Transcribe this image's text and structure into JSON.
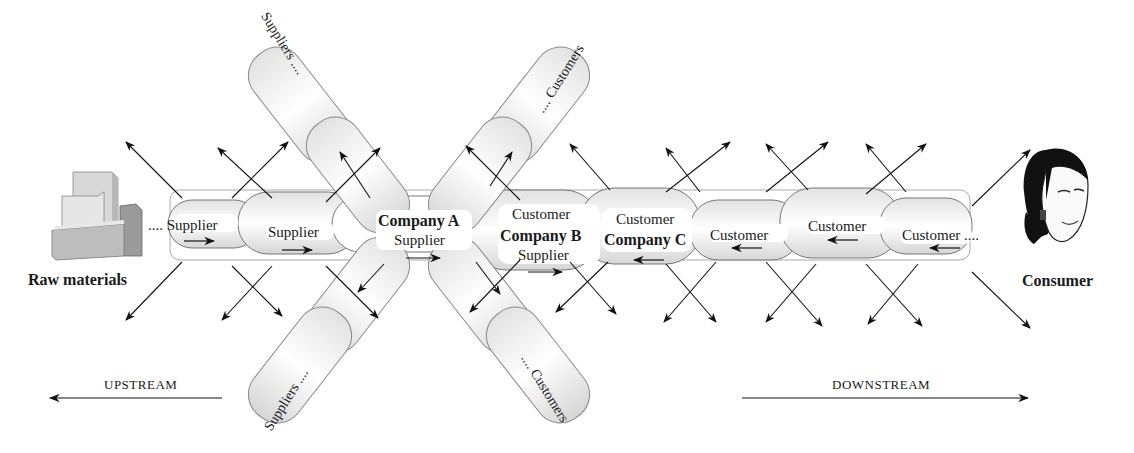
{
  "diagram": {
    "endpoints": {
      "left": {
        "label": "Raw materials",
        "icon": "boxes-icon"
      },
      "right": {
        "label": "Consumer",
        "icon": "consumer-portrait-icon"
      }
    },
    "main_chain": [
      {
        "id": "s1",
        "label": "Supplier",
        "prefix": "....",
        "flow": "right"
      },
      {
        "id": "s2",
        "label": "Supplier",
        "flow": "right"
      },
      {
        "id": "ca",
        "company": "Company A",
        "role": "Supplier",
        "flow": "right"
      },
      {
        "id": "cb",
        "company": "Company B",
        "role_top": "Customer",
        "role": "Supplier",
        "flow": "right"
      },
      {
        "id": "cc",
        "company": "Company C",
        "role_top": "Customer",
        "flow": "left"
      },
      {
        "id": "c1",
        "label": "Customer",
        "flow": "left"
      },
      {
        "id": "c2",
        "label": "Customer",
        "flow": "left"
      },
      {
        "id": "c3",
        "label": "Customer",
        "suffix": "....",
        "flow": "left"
      }
    ],
    "branches": {
      "suppliers_top": "Suppliers ....",
      "customers_top": ".... Customers",
      "suppliers_bottom": "Suppliers ....",
      "customers_bottom": ".... Customers"
    },
    "direction": {
      "upstream": "UPSTREAM",
      "downstream": "DOWNSTREAM"
    }
  },
  "labels": {
    "raw_materials": "Raw materials",
    "consumer": "Consumer",
    "s1": ".... Supplier",
    "s2": "Supplier",
    "company_a": "Company A",
    "company_a_role": "Supplier",
    "company_b_top": "Customer",
    "company_b": "Company B",
    "company_b_role": "Supplier",
    "company_c_top": "Customer",
    "company_c": "Company C",
    "c1": "Customer",
    "c2": "Customer",
    "c3": "Customer ....",
    "suppliers_top": "Suppliers ....",
    "customers_top": ".... Customers",
    "suppliers_bottom": "Suppliers ....",
    "customers_bottom": ".... Customers",
    "upstream": "UPSTREAM",
    "downstream": "DOWNSTREAM"
  }
}
